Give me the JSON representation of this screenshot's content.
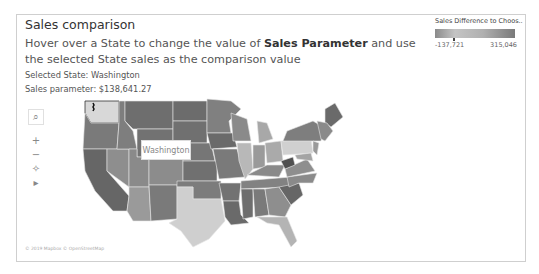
{
  "dashboard": {
    "title": "Sales comparison",
    "subtitle_pre": "Hover over a State to change the value of ",
    "subtitle_bold": "Sales Parameter",
    "subtitle_post": " and use the selected State sales as the comparison value",
    "selected_state_line": "Selected State: Washington",
    "sales_parameter_line": "Sales parameter: $138,641.27"
  },
  "legend": {
    "title": "Sales Difference to Choos..",
    "min_label": "-137,721",
    "max_label": "315,046"
  },
  "map_toolbar": {
    "items": [
      {
        "name": "search-icon",
        "glyph": "⌕"
      },
      {
        "name": "zoom-in-icon",
        "glyph": "+"
      },
      {
        "name": "zoom-out-icon",
        "glyph": "−"
      },
      {
        "name": "pin-icon",
        "glyph": "✧"
      },
      {
        "name": "expand-arrow-icon",
        "glyph": "▸"
      }
    ]
  },
  "map": {
    "tooltip_label": "Washington",
    "attribution": "© 2019 Mapbox © OpenStreetMap",
    "colors": {
      "highlight": "#d8d8d8",
      "dark": "#6e6e6e",
      "mid": "#8e8e8e",
      "light": "#b8b8b8",
      "lighter": "#cfcfcf"
    }
  }
}
